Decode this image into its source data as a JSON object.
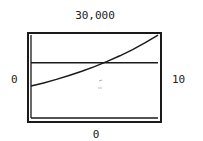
{
  "chart_data": {
    "type": "line",
    "title": "",
    "xlabel": "",
    "ylabel": "",
    "xlim": [
      0,
      10
    ],
    "ylim": [
      0,
      30000
    ],
    "window_labels": {
      "x_min": "0",
      "x_max": "10",
      "y_min": "0",
      "y_max": "30,000"
    },
    "grid": false,
    "legend": null,
    "series": [
      {
        "name": "exponential curve",
        "x": [
          0,
          1,
          2,
          3,
          4,
          5,
          6,
          7,
          8,
          9,
          10
        ],
        "values": [
          11400,
          12540,
          13790,
          15170,
          16690,
          18360,
          20200,
          22210,
          24440,
          26880,
          29570
        ]
      },
      {
        "name": "horizontal line",
        "x": [
          0,
          10
        ],
        "values": [
          19700,
          19700
        ]
      }
    ],
    "annotations": [
      {
        "type": "intersection",
        "x": 5.7,
        "y": 19700
      }
    ]
  },
  "colors": {
    "line": "#1a1a1a",
    "frame": "#1a1a1a",
    "background": "#ffffff"
  }
}
